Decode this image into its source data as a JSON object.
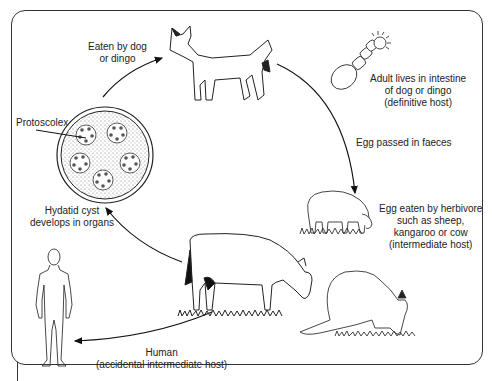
{
  "diagram": {
    "type": "life-cycle",
    "labels": {
      "eaten_by_dog": [
        "Eaten by dog",
        "or dingo"
      ],
      "adult": [
        "Adult lives in intestine",
        "of dog or dingo",
        "(definitive host)"
      ],
      "egg_passed": [
        "Egg passed in faeces"
      ],
      "egg_eaten": [
        "Egg eaten by herbivore",
        "such as sheep,",
        "kangaroo or cow",
        "(intermediate host)"
      ],
      "human": [
        "Human",
        "(accidental intermediate host)"
      ],
      "cyst": [
        "Hydatid cyst",
        "develops in organs"
      ],
      "protoscolex": [
        "Protoscolex"
      ]
    },
    "nodes": [
      "dingo",
      "adult-tapeworm",
      "sheep",
      "kangaroo",
      "cow",
      "human",
      "hydatid-cyst"
    ],
    "edges": [
      {
        "from": "hydatid-cyst",
        "to": "dingo",
        "label": "Eaten by dog or dingo"
      },
      {
        "from": "dingo",
        "to": "sheep",
        "label": "Egg passed in faeces"
      },
      {
        "from": "cow",
        "to": "hydatid-cyst",
        "label": "Hydatid cyst develops in organs"
      },
      {
        "from": "cow",
        "to": "human",
        "label": "Human (accidental intermediate host)"
      }
    ]
  }
}
